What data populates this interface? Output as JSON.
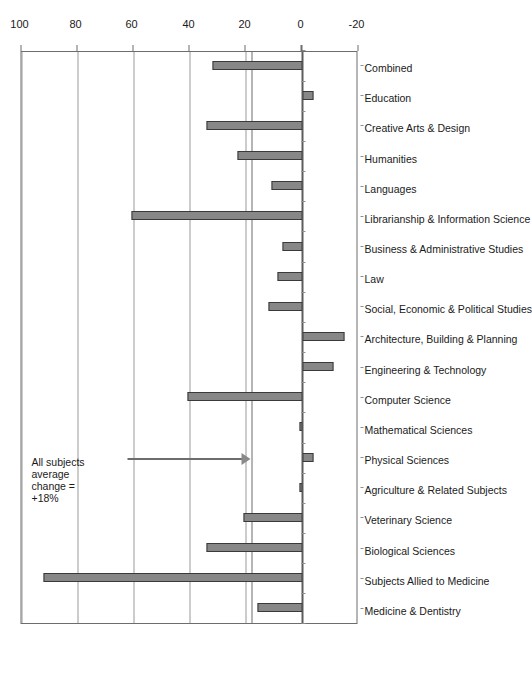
{
  "chart_data": {
    "type": "bar",
    "title": "",
    "subtitle": "",
    "xlabel": "",
    "ylabel": "Percentage",
    "ylim": [
      -20,
      100
    ],
    "ytick_labels": [
      "-20",
      "0",
      "20",
      "40",
      "60",
      "80",
      "100"
    ],
    "ytick_values": [
      -20,
      0,
      20,
      40,
      60,
      80,
      100
    ],
    "grid": "horizontal gridlines at 20, 40, 60, 80, 100",
    "legend_position": "none",
    "orientation": "vertical bars; whole figure rotated 90 degrees counter-clockwise on the page",
    "bar_color": "#878787",
    "bar_edge_color": "#3a3a3a",
    "reference_line": {
      "value": 18,
      "label_lines": [
        "All subjects",
        "average",
        "change =",
        "+18%"
      ],
      "color": "#6d6d6d",
      "marker": "down-arrow"
    },
    "categories": [
      "Medicine & Dentistry",
      "Subjects Allied to Medicine",
      "Biological Sciences",
      "Veterinary Science",
      "Agriculture & Related Subjects",
      "Physical Sciences",
      "Mathematical Sciences",
      "Computer Science",
      "Engineering & Technology",
      "Architecture, Building & Planning",
      "Social, Economic & Political Studies",
      "Law",
      "Business & Administrative Studies",
      "Librarianship & Information Science",
      "Languages",
      "Humanities",
      "Creative Arts & Design",
      "Education",
      "Combined"
    ],
    "values": [
      16,
      92,
      34,
      21,
      1,
      -4,
      1,
      41,
      -11,
      -15,
      12,
      9,
      7,
      61,
      11,
      23,
      34,
      -4,
      32
    ]
  },
  "axis": {
    "value_axis_title": "Percentage"
  }
}
